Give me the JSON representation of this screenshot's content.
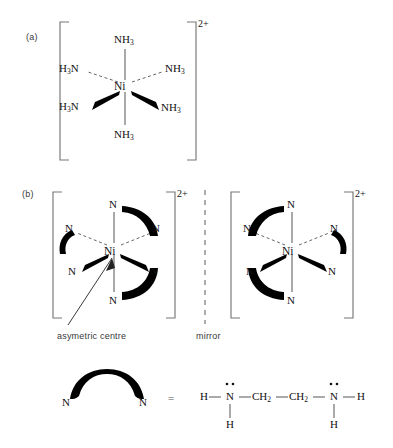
{
  "figure": {
    "title_panels": [
      {
        "id": "a",
        "label": "(a)"
      },
      {
        "id": "b",
        "label": "(b)"
      }
    ],
    "charge": "2+",
    "element_symbols": {
      "metal": "Ni",
      "nitrogen": "N",
      "hydrogen": "H"
    },
    "panel_a": {
      "label": "(a)",
      "charge": "2+",
      "metal": "Ni",
      "description": "hexaamminenickel(II) octahedral complex",
      "ligands": [
        {
          "position": "top",
          "text": "NH3",
          "bond": "plain"
        },
        {
          "position": "upper-left",
          "text": "H3N",
          "bond": "dashed"
        },
        {
          "position": "upper-right",
          "text": "NH3",
          "bond": "dashed"
        },
        {
          "position": "lower-left",
          "text": "H3N",
          "bond": "wedge"
        },
        {
          "position": "lower-right",
          "text": "NH3",
          "bond": "wedge"
        },
        {
          "position": "bottom",
          "text": "NH3",
          "bond": "plain"
        }
      ]
    },
    "panel_b": {
      "label": "(b)",
      "charge": "2+",
      "metal": "Ni",
      "annotation": "asymetric centre",
      "mirror_label": "mirror",
      "enantiomers": [
        {
          "side": "left",
          "ligand_atoms": [
            {
              "position": "top",
              "text": "N",
              "bond": "plain"
            },
            {
              "position": "upper-left",
              "text": "N",
              "bond": "dashed"
            },
            {
              "position": "upper-right",
              "text": "N",
              "bond": "dashed"
            },
            {
              "position": "lower-left",
              "text": "N",
              "bond": "wedge"
            },
            {
              "position": "lower-right",
              "text": "N",
              "bond": "wedge"
            },
            {
              "position": "bottom",
              "text": "N",
              "bond": "plain"
            }
          ],
          "chelate_arcs": [
            "top-to-upper-right",
            "upper-left-to-lower-left",
            "lower-right-to-bottom"
          ]
        },
        {
          "side": "right",
          "ligand_atoms": [
            {
              "position": "top",
              "text": "N",
              "bond": "plain"
            },
            {
              "position": "upper-left",
              "text": "N",
              "bond": "dashed"
            },
            {
              "position": "upper-right",
              "text": "N",
              "bond": "dashed"
            },
            {
              "position": "lower-left",
              "text": "N",
              "bond": "wedge"
            },
            {
              "position": "lower-right",
              "text": "N",
              "bond": "wedge"
            },
            {
              "position": "bottom",
              "text": "N",
              "bond": "plain"
            }
          ],
          "chelate_arcs": [
            "top-to-upper-left",
            "upper-right-to-lower-right",
            "lower-left-to-bottom"
          ]
        }
      ]
    },
    "legend": {
      "arc_left_atom": "N",
      "arc_right_atom": "N",
      "equals": "=",
      "formula": {
        "h_left": "H",
        "n_left": "N",
        "ch2_left": "CH2",
        "ch2_right": "CH2",
        "n_right": "N",
        "h_right": "H",
        "h_below_left": "H",
        "h_below_right": "H",
        "lone_pairs": 2
      }
    },
    "colors": {
      "ink": "#111111",
      "bond_line": "#555555",
      "bracket": "#777777",
      "mirror": "#8a8a8a",
      "label_text": "#3a3a3a",
      "background": "#ffffff"
    }
  }
}
